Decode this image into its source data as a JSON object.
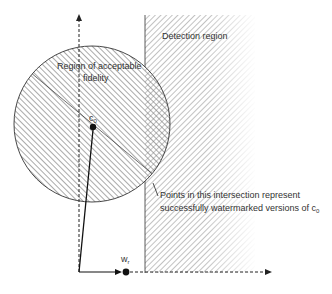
{
  "labels": {
    "detection_region": "Detection region",
    "fidelity_line1": "Region of acceptable",
    "fidelity_line2": "fidelity",
    "c0": "c",
    "c0_sub": "0",
    "wr": "w",
    "wr_sub": "r",
    "intersection_line1": "Points in this intersection represent",
    "intersection_line2": "successfully watermarked versions of c",
    "intersection_sub": "0"
  },
  "colors": {
    "stroke": "#222222",
    "hatch": "#777777",
    "text": "#333333"
  }
}
